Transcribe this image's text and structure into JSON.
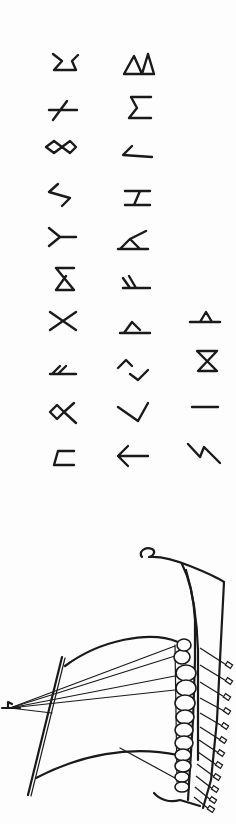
{
  "page": {
    "title": "Runic alphabet with Viking ship illustration",
    "background": "#fdfdfd",
    "ink_color": "#1a1a1a",
    "orientation": "rotated 90 degrees"
  },
  "runes": {
    "columns": [
      {
        "name": "column-1",
        "glyphs": [
          {
            "id": "rune-1-1",
            "shape": "cup-with-hooks"
          },
          {
            "id": "rune-1-2",
            "shape": "horizontal-with-slash"
          },
          {
            "id": "rune-1-3",
            "shape": "double-diamond-cross"
          },
          {
            "id": "rune-1-4",
            "shape": "sowilo-zigzag"
          },
          {
            "id": "rune-1-5",
            "shape": "algiz-sideways"
          },
          {
            "id": "rune-1-6",
            "shape": "dagaz-hourglass-open"
          },
          {
            "id": "rune-1-7",
            "shape": "gebo-x"
          },
          {
            "id": "rune-1-8",
            "shape": "fehu-sideways"
          },
          {
            "id": "rune-1-9",
            "shape": "othala-sideways"
          },
          {
            "id": "rune-1-10",
            "shape": "uruz-sideways"
          }
        ]
      },
      {
        "name": "column-2",
        "glyphs": [
          {
            "id": "rune-2-1",
            "shape": "double-triangle"
          },
          {
            "id": "rune-2-2",
            "shape": "sigma"
          },
          {
            "id": "rune-2-3",
            "shape": "angle-left"
          },
          {
            "id": "rune-2-4",
            "shape": "hagalaz-sideways"
          },
          {
            "id": "rune-2-5",
            "shape": "raido-sideways"
          },
          {
            "id": "rune-2-6",
            "shape": "ansuz-sideways"
          },
          {
            "id": "rune-2-7",
            "shape": "triangle-on-base"
          },
          {
            "id": "rune-2-8",
            "shape": "jera-sideways"
          },
          {
            "id": "rune-2-9",
            "shape": "check-mark"
          },
          {
            "id": "rune-2-10",
            "shape": "arrow-left"
          }
        ]
      },
      {
        "name": "column-3",
        "glyphs": [
          {
            "id": "rune-3-1",
            "shape": "triangle-on-line"
          },
          {
            "id": "rune-3-2",
            "shape": "hourglass"
          },
          {
            "id": "rune-3-3",
            "shape": "isa-horizontal"
          },
          {
            "id": "rune-3-4",
            "shape": "eihwaz-zigzag"
          }
        ]
      }
    ]
  },
  "illustration": {
    "subject": "viking-longship",
    "shield_count": 12,
    "oar_count": 12
  }
}
